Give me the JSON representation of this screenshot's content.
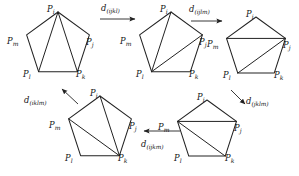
{
  "figure": {
    "background_color": "#ffffff",
    "stroke_color": "#222222",
    "width": 299,
    "height": 176,
    "vertex_labels": {
      "i": "P",
      "j": "P",
      "k": "P",
      "l": "P",
      "m": "P"
    }
  },
  "nodes": [
    {
      "id": "node-1",
      "position": "top-left",
      "center_x": 58,
      "center_y": 45,
      "radius": 33,
      "rotation_deg": 0,
      "labels": [
        {
          "key": "i",
          "base": "P",
          "sub": "i",
          "x": 47,
          "y": 5
        },
        {
          "key": "j",
          "base": "P",
          "sub": "j",
          "x": 86,
          "y": 38
        },
        {
          "key": "k",
          "base": "P",
          "sub": "k",
          "x": 76,
          "y": 70
        },
        {
          "key": "l",
          "base": "P",
          "sub": "l",
          "x": 23,
          "y": 70
        },
        {
          "key": "m",
          "base": "P",
          "sub": "m",
          "x": 7,
          "y": 37
        }
      ],
      "diagonals": [
        [
          "i",
          "l"
        ],
        [
          "i",
          "k"
        ]
      ],
      "fan_apex": "i"
    },
    {
      "id": "node-2",
      "position": "top-center",
      "center_x": 171,
      "center_y": 45,
      "radius": 33,
      "rotation_deg": 0,
      "labels": [
        {
          "key": "i",
          "base": "P",
          "sub": "i",
          "x": 160,
          "y": 5
        },
        {
          "key": "j",
          "base": "P",
          "sub": "j",
          "x": 199,
          "y": 38
        },
        {
          "key": "k",
          "base": "P",
          "sub": "k",
          "x": 189,
          "y": 70
        },
        {
          "key": "l",
          "base": "P",
          "sub": "l",
          "x": 136,
          "y": 70
        },
        {
          "key": "m",
          "base": "P",
          "sub": "m",
          "x": 120,
          "y": 37
        }
      ],
      "diagonals": [
        [
          "l",
          "i"
        ],
        [
          "l",
          "j"
        ]
      ],
      "fan_apex": "l"
    },
    {
      "id": "node-3",
      "position": "top-right",
      "center_x": 256,
      "center_y": 48,
      "radius": 31,
      "rotation_deg": 0,
      "labels": [
        {
          "key": "i",
          "base": "P",
          "sub": "i",
          "x": 246,
          "y": 10
        },
        {
          "key": "j",
          "base": "P",
          "sub": "j",
          "x": 283,
          "y": 41
        },
        {
          "key": "k",
          "base": "P",
          "sub": "k",
          "x": 274,
          "y": 71
        },
        {
          "key": "l",
          "base": "P",
          "sub": "l",
          "x": 223,
          "y": 71
        },
        {
          "key": "m",
          "base": "P",
          "sub": "m",
          "x": 207,
          "y": 40
        }
      ],
      "diagonals": [
        [
          "m",
          "j"
        ],
        [
          "l",
          "j"
        ]
      ],
      "fan_apex": "j"
    },
    {
      "id": "node-4",
      "position": "bottom-right",
      "center_x": 207,
      "center_y": 131,
      "radius": 31,
      "rotation_deg": 0,
      "labels": [
        {
          "key": "i",
          "base": "P",
          "sub": "i",
          "x": 197,
          "y": 93
        },
        {
          "key": "j",
          "base": "P",
          "sub": "j",
          "x": 234,
          "y": 124
        },
        {
          "key": "k",
          "base": "P",
          "sub": "k",
          "x": 225,
          "y": 154
        },
        {
          "key": "l",
          "base": "P",
          "sub": "l",
          "x": 174,
          "y": 154
        },
        {
          "key": "m",
          "base": "P",
          "sub": "m",
          "x": 158,
          "y": 123
        }
      ],
      "diagonals": [
        [
          "m",
          "j"
        ],
        [
          "m",
          "k"
        ]
      ],
      "fan_apex": "m"
    },
    {
      "id": "node-5",
      "position": "bottom-left",
      "center_x": 100,
      "center_y": 129,
      "radius": 33,
      "rotation_deg": 0,
      "labels": [
        {
          "key": "i",
          "base": "P",
          "sub": "i",
          "x": 90,
          "y": 89
        },
        {
          "key": "j",
          "base": "P",
          "sub": "j",
          "x": 129,
          "y": 122
        },
        {
          "key": "k",
          "base": "P",
          "sub": "k",
          "x": 118,
          "y": 154
        },
        {
          "key": "l",
          "base": "P",
          "sub": "l",
          "x": 65,
          "y": 154
        },
        {
          "key": "m",
          "base": "P",
          "sub": "m",
          "x": 49,
          "y": 121
        }
      ],
      "diagonals": [
        [
          "m",
          "k"
        ],
        [
          "i",
          "k"
        ]
      ],
      "fan_apex": "k"
    }
  ],
  "arrows": [
    {
      "id": "arrow-1",
      "from": "node-1",
      "to": "node-2",
      "x1": 100,
      "y1": 19,
      "x2": 135,
      "y2": 19,
      "label": {
        "base": "d",
        "sub": "(ijkl)",
        "x": 101,
        "y": 4
      }
    },
    {
      "id": "arrow-2",
      "from": "node-2",
      "to": "node-3",
      "x1": 191,
      "y1": 21,
      "x2": 222,
      "y2": 21,
      "label": {
        "base": "d",
        "sub": "(ijlm)",
        "x": 189,
        "y": 5
      }
    },
    {
      "id": "arrow-3",
      "from": "node-3",
      "to": "node-4",
      "x1": 231,
      "y1": 90,
      "x2": 245,
      "y2": 104,
      "label": {
        "base": "d",
        "sub": "(jklm)",
        "x": 246,
        "y": 97
      }
    },
    {
      "id": "arrow-4",
      "from": "node-4",
      "to": "node-5",
      "x1": 180,
      "y1": 131,
      "x2": 144,
      "y2": 131,
      "label": {
        "base": "d",
        "sub": "(ijkm)",
        "x": 141,
        "y": 140
      }
    },
    {
      "id": "arrow-5",
      "from": "node-5",
      "to": "node-1",
      "x1": 78,
      "y1": 104,
      "x2": 62,
      "y2": 89,
      "label": {
        "base": "d",
        "sub": "(iklm)",
        "x": 24,
        "y": 96
      }
    }
  ]
}
